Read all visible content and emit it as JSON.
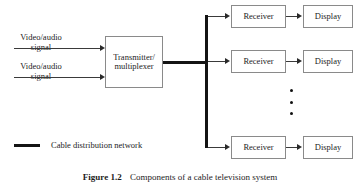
{
  "figure": {
    "caption_label": "Figure 1.2",
    "caption_text": "Components of a cable television system",
    "legend": {
      "marker": "thick-line-swatch",
      "label": "Cable distribution network"
    },
    "colors": {
      "trunk": "#141414",
      "wire": "#3a3a3a",
      "box_border": "#8a8a8a",
      "background": "#ffffff",
      "text": "#1c1c1c"
    },
    "inputs": [
      {
        "line1": "Video/audio",
        "line2": "signal"
      },
      {
        "line1": "Video/audio",
        "line2": "signal"
      }
    ],
    "transmitter": {
      "line1": "Transmitter/",
      "line2": "multiplexer"
    },
    "branches": [
      {
        "receiver": "Receiver",
        "display": "Display"
      },
      {
        "receiver": "Receiver",
        "display": "Display"
      },
      {
        "receiver": "Receiver",
        "display": "Display"
      }
    ],
    "continuation": {
      "glyph": "vertical-ellipsis",
      "dot_count": 3
    }
  }
}
